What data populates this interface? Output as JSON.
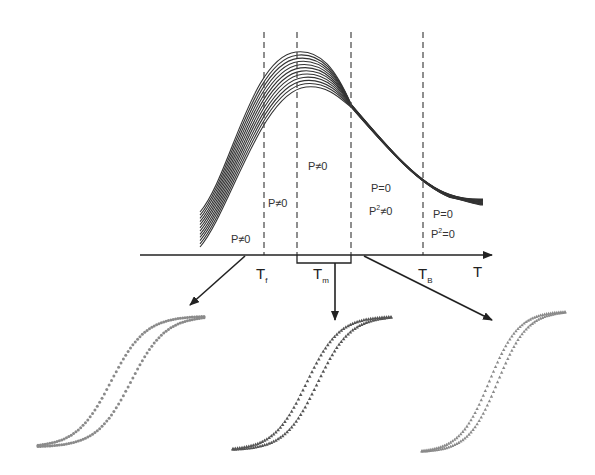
{
  "diagram": {
    "type": "magnetic-phase-diagram",
    "axis": {
      "label": "T",
      "ticks": [
        {
          "id": "Tf",
          "main": "T",
          "sub": "f"
        },
        {
          "id": "Tm",
          "main": "T",
          "sub": "m"
        },
        {
          "id": "TB",
          "main": "T",
          "sub": "B"
        }
      ]
    },
    "dashed_lines_x": [
      264,
      297,
      351,
      423
    ],
    "regions": [
      {
        "id": "region-1",
        "lines": [
          "P≠0"
        ]
      },
      {
        "id": "region-2",
        "lines": [
          "P≠0"
        ]
      },
      {
        "id": "region-3",
        "lines": [
          "P≠0"
        ]
      },
      {
        "id": "region-4",
        "lines": [
          "P=0",
          "P²≠0"
        ]
      },
      {
        "id": "region-5",
        "lines": [
          "P=0",
          "P²=0"
        ]
      }
    ],
    "labels": {
      "r1": "P≠0",
      "r2": "P≠0",
      "r3": "P≠0",
      "r4a": "P=0",
      "r4b_main": "P",
      "r4b_sup": "2",
      "r4b_rest": "≠0",
      "r5a": "P=0",
      "r5b_main": "P",
      "r5b_sup": "2",
      "r5b_rest": "=0",
      "axis_T": "T",
      "tf_main": "T",
      "tf_sub": "f",
      "tm_main": "T",
      "tm_sub": "m",
      "tb_main": "T",
      "tb_sub": "B"
    },
    "curve_family": {
      "count": 12,
      "description": "susceptibility vs temperature curves, peaking near Tm"
    },
    "hysteresis_loops": [
      {
        "id": "loop-left",
        "marker": "circle",
        "color": "#8a8a8a",
        "note": "open hysteresis loop below Tf"
      },
      {
        "id": "loop-middle",
        "marker": "triangle",
        "color": "#555555",
        "note": "narrow hysteresis loop near Tm"
      },
      {
        "id": "loop-right",
        "marker": "triangle",
        "color": "#8a8a8a",
        "note": "narrow loop above TB"
      }
    ],
    "colors": {
      "line": "#222222",
      "curves": "#333333",
      "dashes": "#444444"
    }
  }
}
